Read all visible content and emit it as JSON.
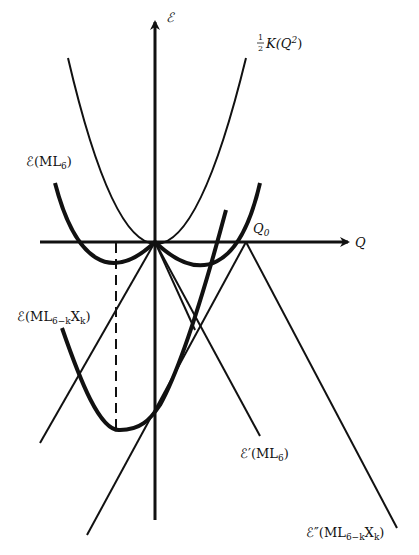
{
  "diagram": {
    "axes": {
      "y_label": "ℰ",
      "x_label": "Q",
      "q0_label": "Q",
      "q0_sub": "0"
    },
    "curves": {
      "harmonic": {
        "label_frac_num": "1",
        "label_frac_den": "2",
        "label_text": "K(Q",
        "label_sup": "2",
        "label_close": ")"
      },
      "ml6": {
        "label_main": "ℰ(ML",
        "label_sub": "6",
        "label_close": ")"
      },
      "ml6k": {
        "label_main": "ℰ(ML",
        "label_sub": "6−k",
        "label_mid": "X",
        "label_sub2": "k",
        "label_close": ")"
      },
      "ml6_prime": {
        "label_main": "ℰ′(ML",
        "label_sub": "6",
        "label_close": ")"
      },
      "ml6k_double_prime": {
        "label_main": "ℰ″(ML",
        "label_sub": "6−k",
        "label_mid": "X",
        "label_sub2": "k",
        "label_close": ")"
      }
    },
    "colors": {
      "ink": "#111111",
      "background": "#ffffff"
    }
  }
}
